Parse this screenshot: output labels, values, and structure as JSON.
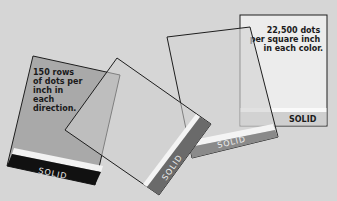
{
  "cards": [
    {
      "id": "card-1",
      "caption_lines": [
        "150 rows",
        "of dots per",
        "inch in",
        "each",
        "direction."
      ],
      "band_label": "SOLID",
      "fill": "#a9a9a9",
      "band": "#111111"
    },
    {
      "id": "card-2",
      "band_label": "SOLID",
      "fill": "#cfcfcf",
      "band": "#6a6a6a"
    },
    {
      "id": "card-3",
      "band_label": "SOLID",
      "fill": "#d4d4d4",
      "band": "#8a8a8a"
    },
    {
      "id": "card-4",
      "caption_lines": [
        "22,500 dots",
        "per square inch",
        "in each color."
      ],
      "band_label": "SOLID",
      "fill": "#ececec",
      "band": "#cfcfcf"
    }
  ],
  "colors": {
    "background": "#d6d6d6",
    "outline": "#1e1e1e"
  }
}
